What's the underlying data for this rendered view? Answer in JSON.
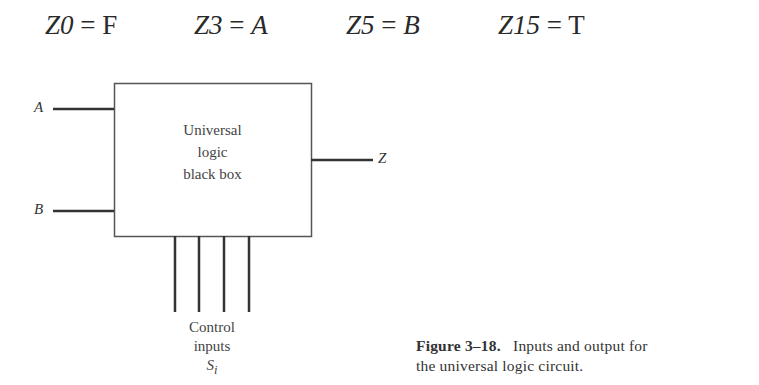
{
  "equations": [
    {
      "lhs": "Z0",
      "rhs": "F",
      "rhs_italic": false
    },
    {
      "lhs": "Z3",
      "rhs": "A",
      "rhs_italic": true
    },
    {
      "lhs": "Z5",
      "rhs": "B",
      "rhs_italic": true
    },
    {
      "lhs": "Z15",
      "rhs": "T",
      "rhs_italic": false
    }
  ],
  "equals": "=",
  "diagram": {
    "inputs": {
      "a": "A",
      "b": "B"
    },
    "output": "Z",
    "box_lines": [
      "Universal",
      "logic",
      "black box"
    ],
    "control_label": [
      "Control",
      "inputs"
    ],
    "control_symbol": "S",
    "control_subscript": "i",
    "control_line_count": 4
  },
  "caption": {
    "label": "Figure 3–18.",
    "text_line1": "Inputs and output for",
    "text_line2": "the universal logic circuit."
  }
}
